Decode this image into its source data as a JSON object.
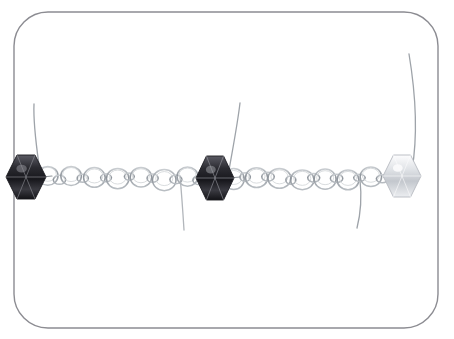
{
  "image": {
    "kind": "product-photograph",
    "subject": "handmade beaded silver chain jewelry segment",
    "alt_text": "Close-up photograph of a silver round-link chain with three bicone crystal beads wire-wrapped along it, inside a rounded rectangle frame",
    "width": 454,
    "height": 339,
    "background_color": "#ffffff"
  },
  "frame": {
    "name": "rounded-rectangle-border",
    "x": 14,
    "y": 12,
    "width": 424,
    "height": 316,
    "corner_radius": 34,
    "stroke_color": "#8c8c92",
    "stroke_width": 1.4,
    "fill_color": "#ffffff"
  },
  "chain": {
    "baseline_y": 178,
    "link_stroke_color": "#9aa0a6",
    "link_stroke_width": 1.5,
    "link_highlight_color": "#cfd3d6",
    "large_link_radius_x": 11,
    "large_link_radius_y": 10,
    "small_link_radius_x": 5.5,
    "small_link_radius_y": 4,
    "segments": [
      {
        "name": "left-chain-segment",
        "start_x": 42,
        "end_x": 205,
        "link_count": 14
      },
      {
        "name": "right-chain-segment",
        "start_x": 228,
        "end_x": 388,
        "link_count": 14
      }
    ]
  },
  "beads": [
    {
      "name": "bead-left-dark-bicone",
      "type": "bicone-crystal",
      "tone": "dark",
      "center_x": 26,
      "center_y": 177,
      "half_width": 20,
      "half_height": 22,
      "body_color": "#2d2d33",
      "shade_color": "#17171c",
      "highlight_color": "#8f9097"
    },
    {
      "name": "bead-center-dark-bicone",
      "type": "bicone-crystal",
      "tone": "dark",
      "center_x": 215,
      "center_y": 178,
      "half_width": 19,
      "half_height": 22,
      "body_color": "#35353b",
      "shade_color": "#1b1b20",
      "highlight_color": "#9b9ca3"
    },
    {
      "name": "bead-right-clear-bicone",
      "type": "bicone-crystal",
      "tone": "clear",
      "center_x": 402,
      "center_y": 176,
      "half_width": 19,
      "half_height": 21,
      "body_color": "#e4e6ea",
      "shade_color": "#b6b9bf",
      "highlight_color": "#fbfbfc"
    }
  ],
  "wires": {
    "stroke_color": "#9ea3a9",
    "stroke_width": 1.3,
    "tails": [
      {
        "name": "wire-tail-left-up",
        "path": "M 40 172 C 37 150 33 126 34 104"
      },
      {
        "name": "wire-tail-mid-left-down",
        "path": "M 180 176 C 182 198 183 214 184 230"
      },
      {
        "name": "wire-tail-center-up",
        "path": "M 228 176 C 232 152 237 128 240 103"
      },
      {
        "name": "wire-tail-right-down",
        "path": "M 360 180 C 362 198 361 212 357 228"
      },
      {
        "name": "wire-tail-far-right-up",
        "path": "M 412 170 C 418 134 415 90 409 54"
      }
    ]
  },
  "labels": {
    "caption": "",
    "title": ""
  }
}
